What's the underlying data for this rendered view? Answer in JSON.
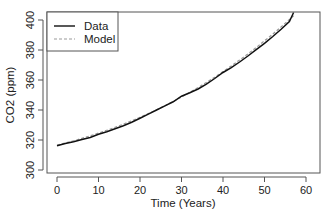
{
  "chart_data": {
    "type": "line",
    "title": "",
    "xlabel": "Time (Years)",
    "ylabel": "CO2 (ppm)",
    "xlim": [
      -2.4,
      63.4
    ],
    "ylim": [
      298,
      405
    ],
    "xticks": [
      0,
      10,
      20,
      30,
      40,
      50,
      60
    ],
    "yticks": [
      300,
      320,
      340,
      360,
      380,
      400
    ],
    "grid": false,
    "legend_position": "top-left",
    "series": [
      {
        "name": "Data",
        "style": "solid",
        "color": "#111111",
        "x": [
          0,
          2,
          4,
          6,
          8,
          10,
          12,
          14,
          16,
          18,
          20,
          22,
          24,
          26,
          28,
          30,
          32,
          34,
          36,
          38,
          40,
          42,
          44,
          46,
          48,
          50,
          52,
          54,
          56,
          57
        ],
        "y": [
          316.2,
          317.6,
          318.9,
          320.3,
          321.7,
          323.9,
          325.5,
          327.5,
          329.5,
          331.8,
          334.5,
          337.2,
          340.0,
          342.8,
          345.5,
          349.2,
          351.5,
          354.0,
          357.2,
          361.0,
          365.0,
          368.2,
          372.0,
          376.0,
          380.2,
          384.5,
          389.0,
          393.8,
          399.0,
          405.0
        ]
      },
      {
        "name": "Model",
        "style": "dashed",
        "color": "#9a9a9a",
        "x": [
          0,
          2,
          4,
          6,
          8,
          10,
          12,
          14,
          16,
          18,
          20,
          22,
          24,
          26,
          28,
          30,
          32,
          34,
          36,
          38,
          40,
          42,
          44,
          46,
          48,
          50,
          52,
          54,
          56,
          57
        ],
        "y": [
          316.6,
          318.0,
          319.5,
          321.1,
          322.8,
          324.6,
          326.5,
          328.5,
          330.6,
          332.8,
          335.1,
          337.6,
          340.2,
          342.9,
          345.7,
          348.7,
          351.8,
          355.0,
          358.4,
          361.9,
          365.6,
          369.4,
          373.3,
          377.4,
          381.7,
          386.1,
          390.6,
          395.4,
          400.3,
          402.8
        ]
      }
    ]
  },
  "legend": {
    "items": [
      {
        "label": "Data",
        "style": "solid",
        "color": "#111111"
      },
      {
        "label": "Model",
        "style": "dashed",
        "color": "#9a9a9a"
      }
    ]
  },
  "axes": {
    "x_title": "Time (Years)",
    "y_title": "CO2 (ppm)",
    "x_tick_labels": [
      "0",
      "10",
      "20",
      "30",
      "40",
      "50",
      "60"
    ],
    "y_tick_labels": [
      "300",
      "320",
      "340",
      "360",
      "380",
      "400"
    ]
  }
}
